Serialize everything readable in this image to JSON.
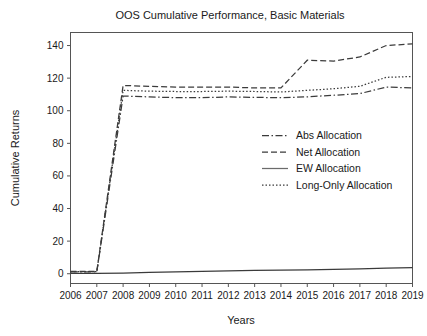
{
  "chart_data": {
    "type": "line",
    "title": "OOS Cumulative Performance, Basic Materials",
    "xlabel": "Years",
    "ylabel": "Cumulative Returns",
    "x": [
      2006,
      2007,
      2008,
      2009,
      2010,
      2011,
      2012,
      2013,
      2014,
      2015,
      2016,
      2017,
      2018,
      2019
    ],
    "categories": [
      "2006",
      "2007",
      "2008",
      "2009",
      "2010",
      "2011",
      "2012",
      "2013",
      "2014",
      "2015",
      "2016",
      "2017",
      "2018",
      "2019"
    ],
    "xlim": [
      2006,
      2019
    ],
    "ylim": [
      -6,
      148
    ],
    "yticks": [
      0,
      20,
      40,
      60,
      80,
      100,
      120,
      140
    ],
    "ytick_labels": [
      "0",
      "20",
      "40",
      "60",
      "80",
      "100",
      "120",
      "140"
    ],
    "grid": false,
    "legend_position": "center-right",
    "series": [
      {
        "name": "Abs Allocation",
        "style": "dashdot",
        "color": "#3b3b3b",
        "values": [
          1.2,
          1.2,
          109.0,
          108.5,
          108.0,
          108.0,
          108.5,
          108.2,
          108.0,
          108.5,
          109.5,
          110.5,
          114.5,
          114.0
        ]
      },
      {
        "name": "Net Allocation",
        "style": "dashed",
        "color": "#3b3b3b",
        "values": [
          1.5,
          1.5,
          115.5,
          115.0,
          114.5,
          114.5,
          114.5,
          114.0,
          114.0,
          131.0,
          130.5,
          133.0,
          140.0,
          141.0
        ]
      },
      {
        "name": "EW Allocation",
        "style": "solid",
        "color": "#6b6b6b",
        "values": [
          0.2,
          0.2,
          0.4,
          0.8,
          1.2,
          1.5,
          1.8,
          2.0,
          2.2,
          2.4,
          2.7,
          3.0,
          3.4,
          3.8
        ]
      },
      {
        "name": "Long-Only Allocation",
        "style": "dotted",
        "color": "#3b3b3b",
        "values": [
          1.3,
          1.3,
          112.5,
          112.0,
          111.8,
          111.8,
          112.0,
          111.8,
          111.5,
          112.5,
          113.5,
          115.0,
          120.5,
          121.0
        ]
      }
    ]
  },
  "legend": {
    "items": [
      {
        "label": "Abs Allocation"
      },
      {
        "label": "Net Allocation"
      },
      {
        "label": "EW Allocation"
      },
      {
        "label": "Long-Only Allocation"
      }
    ]
  },
  "colors": {
    "background": "#ffffff",
    "axis": "#555555",
    "line": "#3b3b3b",
    "ew_line": "#6b6b6b",
    "text": "#1a1a1a"
  }
}
